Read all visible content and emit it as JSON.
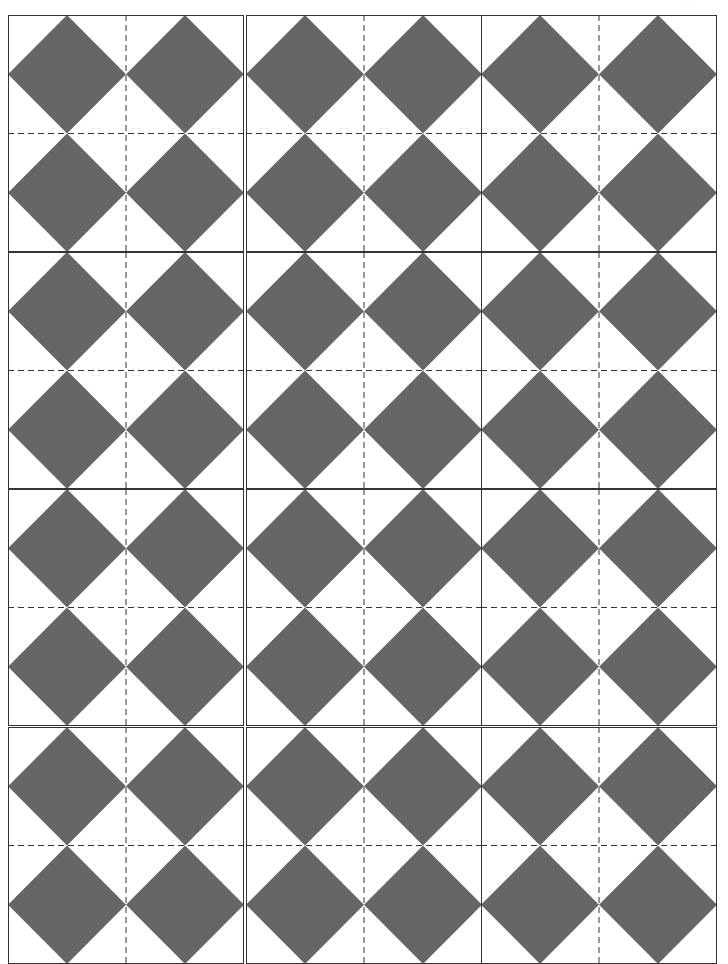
{
  "page": {
    "header_mark": "· · ·"
  },
  "pattern": {
    "rows": 4,
    "cols": 3,
    "tile_size_px": 236,
    "motif": "x-cross-of-four-diamonds",
    "fill_color": "#666666",
    "background_color": "#ffffff",
    "border_color": "#333333",
    "guide_line_color": "#333333",
    "guide_line_style": "dashed"
  },
  "tiles": [
    {
      "row": 1,
      "col": 1
    },
    {
      "row": 1,
      "col": 2
    },
    {
      "row": 1,
      "col": 3
    },
    {
      "row": 2,
      "col": 1
    },
    {
      "row": 2,
      "col": 2
    },
    {
      "row": 2,
      "col": 3
    },
    {
      "row": 3,
      "col": 1
    },
    {
      "row": 3,
      "col": 2
    },
    {
      "row": 3,
      "col": 3
    },
    {
      "row": 4,
      "col": 1
    },
    {
      "row": 4,
      "col": 2
    },
    {
      "row": 4,
      "col": 3
    }
  ]
}
